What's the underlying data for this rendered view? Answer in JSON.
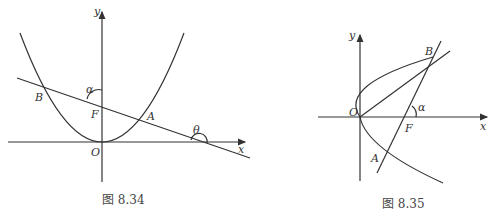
{
  "figures": [
    {
      "caption": "图 8.34",
      "labels": {
        "y": "y",
        "x": "x",
        "O": "O",
        "F": "F",
        "A": "A",
        "B": "B",
        "alpha": "α",
        "theta": "θ"
      },
      "description": "Upward parabola with vertex at origin O, focus F on y-axis, chord AB through F, line making angle α with y-axis and θ with x-axis"
    },
    {
      "caption": "图 8.35",
      "labels": {
        "y": "y",
        "x": "x",
        "O": "O",
        "F": "F",
        "A": "A",
        "B": "B",
        "alpha": "α"
      },
      "description": "Rightward parabola with vertex at origin O, focus F on x-axis, focal chord AB with inclination angle α, segment OB"
    }
  ]
}
